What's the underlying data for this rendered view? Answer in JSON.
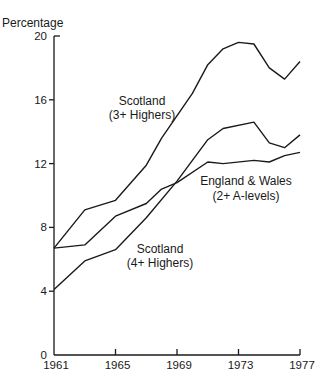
{
  "chart_data": {
    "type": "line",
    "title": "",
    "xlabel": "",
    "ylabel": "Percentage",
    "xlim": [
      1961,
      1977
    ],
    "ylim": [
      0,
      20
    ],
    "grid": false,
    "legend": "inline labels",
    "x_ticks": [
      "1961",
      "1965",
      "1969",
      "1973",
      "1977"
    ],
    "y_ticks": [
      "0",
      "4",
      "8",
      "12",
      "16",
      "20"
    ],
    "x": [
      1961,
      1963,
      1965,
      1967,
      1969,
      1971,
      1972,
      1973,
      1974,
      1975,
      1976,
      1977
    ],
    "series": [
      {
        "name": "Scotland (3+ Highers)",
        "label_lines": [
          "Scotland",
          "(3+ Highers)"
        ],
        "points": [
          [
            1961,
            6.7
          ],
          [
            1963,
            9.1
          ],
          [
            1965,
            9.7
          ],
          [
            1967,
            11.9
          ],
          [
            1968,
            13.6
          ],
          [
            1970,
            16.4
          ],
          [
            1971,
            18.2
          ],
          [
            1972,
            19.2
          ],
          [
            1973,
            19.6
          ],
          [
            1974,
            19.5
          ],
          [
            1975,
            18.0
          ],
          [
            1976,
            17.3
          ],
          [
            1977,
            18.4
          ]
        ]
      },
      {
        "name": "Scotland (4+ Highers)",
        "label_lines": [
          "Scotland",
          "(4+ Highers)"
        ],
        "points": [
          [
            1961,
            4.1
          ],
          [
            1963,
            5.9
          ],
          [
            1965,
            6.6
          ],
          [
            1967,
            8.6
          ],
          [
            1969,
            10.9
          ],
          [
            1970,
            12.2
          ],
          [
            1971,
            13.5
          ],
          [
            1972,
            14.2
          ],
          [
            1974,
            14.6
          ],
          [
            1975,
            13.3
          ],
          [
            1976,
            13.0
          ],
          [
            1977,
            13.8
          ]
        ]
      },
      {
        "name": "England & Wales (2+ A-levels)",
        "label_lines": [
          "England & Wales",
          "(2+ A-levels)"
        ],
        "points": [
          [
            1961,
            6.7
          ],
          [
            1963,
            6.9
          ],
          [
            1965,
            8.7
          ],
          [
            1967,
            9.5
          ],
          [
            1968,
            10.4
          ],
          [
            1969,
            10.8
          ],
          [
            1971,
            12.1
          ],
          [
            1972,
            12.0
          ],
          [
            1974,
            12.2
          ],
          [
            1975,
            12.1
          ],
          [
            1976,
            12.5
          ],
          [
            1977,
            12.7
          ]
        ]
      }
    ]
  }
}
